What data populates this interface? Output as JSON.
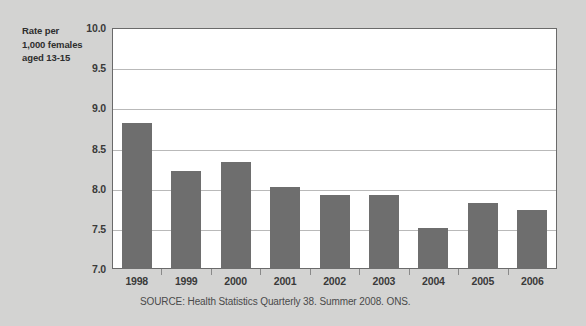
{
  "chart_data": {
    "type": "bar",
    "title": "",
    "subtitle": "",
    "xlabel": "",
    "ylabel": "Rate per 1,000 females aged 13-15",
    "ylabel_lines": [
      "Rate per",
      "1,000 females",
      "aged 13-15"
    ],
    "categories": [
      "1998",
      "1999",
      "2000",
      "2001",
      "2002",
      "2003",
      "2004",
      "2005",
      "2006"
    ],
    "values": [
      8.82,
      8.22,
      8.33,
      8.02,
      7.92,
      7.92,
      7.51,
      7.82,
      7.73
    ],
    "ylim": [
      7.0,
      10.0
    ],
    "ytick_values": [
      7.0,
      7.5,
      8.0,
      8.5,
      9.0,
      9.5,
      10.0
    ],
    "ytick_labels": [
      "7.0",
      "7.5",
      "8.0",
      "8.5",
      "9.0",
      "9.5",
      "10.0"
    ],
    "grid": true,
    "legend": "none",
    "bar_color": "#6e6e6e",
    "plot_background": "#ffffff",
    "figure_background": "#d3d3d2",
    "grid_color": "#b9b9b9",
    "axis_color": "#6a6a6a"
  },
  "source": {
    "note": "SOURCE: Health Statistics Quarterly 38. Summer 2008. ONS."
  }
}
